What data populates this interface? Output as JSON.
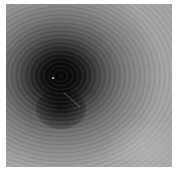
{
  "image": {
    "description": "Grayscale radial intensity pattern with concentric ring fringes and a dark central blob",
    "colors": {
      "center": "#050505",
      "mid": "#585858",
      "edge": "#a2a2a2",
      "border": "#ffffff"
    },
    "features": [
      "dark-central-blob",
      "concentric-rings",
      "bright-point",
      "diagonal-streak"
    ]
  }
}
